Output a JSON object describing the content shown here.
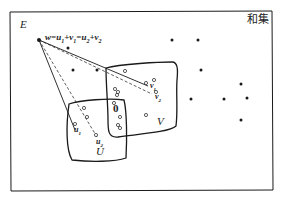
{
  "diagram": {
    "title": "和集",
    "space_label": "E",
    "subspace_u_label": "U",
    "subspace_v_label": "V",
    "zero_label": "0",
    "w_equation": {
      "w": "w",
      "eq1": "=",
      "u1": "u",
      "u1_sub": "1",
      "plus1": "+",
      "v1": "v",
      "v1_sub": "1",
      "eq2": "=",
      "u2": "u",
      "u2_sub": "2",
      "plus2": "+",
      "v2": "v",
      "v2_sub": "2"
    },
    "point_labels": {
      "u1": "u",
      "u1_sub": "1",
      "u2": "u",
      "u2_sub": "2",
      "v1": "v",
      "v1_sub": "1",
      "v2": "v",
      "v2_sub": "2"
    },
    "colors": {
      "stroke": "#1a1a1a",
      "background": "#ffffff"
    }
  }
}
